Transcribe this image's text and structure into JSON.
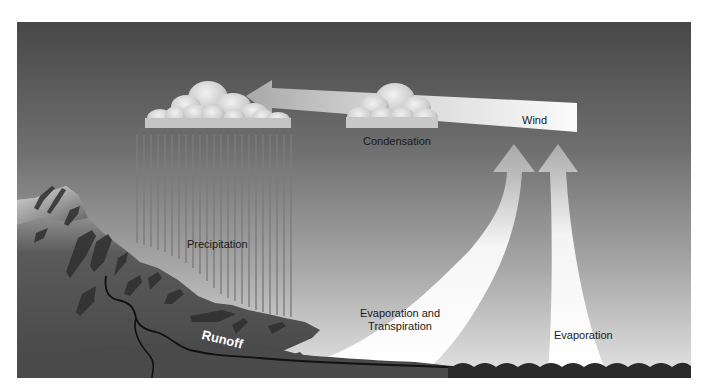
{
  "diagram": {
    "colors": {
      "sky_top": "#4a4a4a",
      "sky_bottom": "#e2e2e2",
      "mountain": "#4e4e4e",
      "mountain_dark": "#2e2e2e",
      "water": "#2a2a2a",
      "arrow_light": "#ffffff",
      "cloud": "#d8d8d8",
      "rain_line": "#7a7a7a",
      "river": "#111111"
    },
    "labels": {
      "condensation": "Condensation",
      "wind": "Wind",
      "precipitation": "Precipitation",
      "runoff": "Runoff",
      "evapotranspiration_line1": "Evaporation and",
      "evapotranspiration_line2": "Transpiration",
      "evaporation": "Evaporation"
    },
    "elements": [
      {
        "name": "rain-cloud",
        "label": ""
      },
      {
        "name": "condensation-cloud",
        "label": "Condensation"
      },
      {
        "name": "wind-arrow",
        "label": "Wind"
      },
      {
        "name": "precipitation-lines",
        "label": "Precipitation"
      },
      {
        "name": "mountain",
        "label": ""
      },
      {
        "name": "runoff-river",
        "label": "Runoff"
      },
      {
        "name": "evapotranspiration-arrow",
        "label": "Evaporation and Transpiration"
      },
      {
        "name": "evaporation-arrow",
        "label": "Evaporation"
      },
      {
        "name": "ocean",
        "label": ""
      }
    ]
  }
}
